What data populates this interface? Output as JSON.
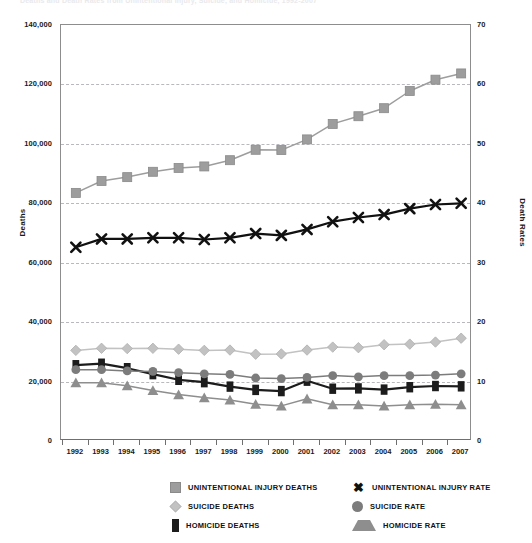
{
  "title_clipped": "Deaths and Death Rates from Unintentional Injury, Suicide, and Homicide, 1992-2007",
  "axes": {
    "left_label": "Deaths",
    "right_label": "Death Rates",
    "left_ticks": [
      "0",
      "20,000",
      "40,000",
      "60,000",
      "80,000",
      "100,000",
      "120,000",
      "140,000"
    ],
    "right_ticks": [
      "0",
      "10",
      "20",
      "30",
      "40",
      "50",
      "60",
      "70"
    ],
    "x_ticks": [
      "1992",
      "1993",
      "1994",
      "1995",
      "1996",
      "1997",
      "1998",
      "1999",
      "2000",
      "2001",
      "2002",
      "2003",
      "2004",
      "2005",
      "2006",
      "2007"
    ]
  },
  "legend": {
    "left_column": [
      {
        "label": "UNINTENTIONAL INJURY DEATHS",
        "marker": "square-marker",
        "color": "#9d9d9d"
      },
      {
        "label": "SUICIDE DEATHS",
        "marker": "diamond-marker",
        "color": "#c2c2c2"
      },
      {
        "label": "HOMICIDE DEATHS",
        "marker": "black-square-marker",
        "color": "#1c1c1c"
      }
    ],
    "right_column": [
      {
        "label": "UNINTENTIONAL INJURY RATE",
        "marker": "x-marker",
        "color": "#111111"
      },
      {
        "label": "SUICIDE RATE",
        "marker": "circle-marker",
        "color": "#7c7c7c"
      },
      {
        "label": "HOMICIDE RATE",
        "marker": "triangle-marker",
        "color": "#8e8e8e"
      }
    ]
  },
  "chart_data": {
    "type": "line",
    "title": "Deaths and Death Rates from Unintentional Injury, Suicide, and Homicide, 1992-2007",
    "xlabel": "",
    "ylabel": "Deaths",
    "y2label": "Death Rates",
    "ylim": [
      0,
      140000
    ],
    "y2lim": [
      0,
      70
    ],
    "grid": true,
    "legend_position": "bottom",
    "x": [
      "1992",
      "1993",
      "1994",
      "1995",
      "1996",
      "1997",
      "1998",
      "1999",
      "2000",
      "2001",
      "2002",
      "2003",
      "2004",
      "2005",
      "2006",
      "2007"
    ],
    "series": [
      {
        "name": "UNINTENTIONAL INJURY DEATHS",
        "axis": "left",
        "marker": "square",
        "color": "#9d9d9d",
        "values": [
          83500,
          87500,
          88800,
          90600,
          91900,
          92400,
          94500,
          98000,
          97900,
          101500,
          106700,
          109300,
          112000,
          117800,
          121600,
          123700
        ]
      },
      {
        "name": "SUICIDE DEATHS",
        "axis": "left",
        "marker": "diamond",
        "color": "#c2c2c2",
        "values": [
          30500,
          31200,
          31100,
          31200,
          30900,
          30500,
          30600,
          29200,
          29300,
          30600,
          31600,
          31400,
          32400,
          32600,
          33300,
          34600
        ]
      },
      {
        "name": "HOMICIDE DEATHS",
        "axis": "left",
        "marker": "black-square",
        "color": "#1c1c1c",
        "values": [
          25500,
          26000,
          24500,
          22500,
          20600,
          19800,
          18300,
          17200,
          16800,
          20300,
          17600,
          17700,
          17300,
          18100,
          18500,
          18400
        ]
      },
      {
        "name": "UNINTENTIONAL INJURY RATE",
        "axis": "right",
        "marker": "x",
        "color": "#111111",
        "values": [
          32.6,
          34.0,
          34.0,
          34.2,
          34.2,
          33.9,
          34.2,
          34.9,
          34.6,
          35.6,
          36.9,
          37.6,
          38.1,
          39.1,
          39.8,
          40.0
        ]
      },
      {
        "name": "SUICIDE RATE",
        "axis": "right",
        "marker": "circle",
        "color": "#7c7c7c",
        "values": [
          12.0,
          12.0,
          11.8,
          11.7,
          11.5,
          11.3,
          11.2,
          10.6,
          10.5,
          10.7,
          11.0,
          10.8,
          11.0,
          11.0,
          11.1,
          11.3
        ]
      },
      {
        "name": "HOMICIDE RATE",
        "axis": "right",
        "marker": "triangle",
        "color": "#8e8e8e",
        "values": [
          9.8,
          9.8,
          9.3,
          8.5,
          7.8,
          7.3,
          6.9,
          6.2,
          5.9,
          7.1,
          6.1,
          6.1,
          5.9,
          6.1,
          6.2,
          6.1
        ]
      }
    ]
  }
}
